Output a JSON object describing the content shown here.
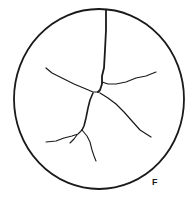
{
  "figure": {
    "label": "F",
    "stroke_color": "#1a1a1a",
    "background": "#ffffff",
    "circle": {
      "cx": 99,
      "cy": 99,
      "rx": 85,
      "ry": 90
    },
    "cracks": [
      {
        "name": "crack-main-vertical",
        "points": "106,10 106,30 105,50 104,68 102,76 102,84 100,90 98,92",
        "width": 1.8
      },
      {
        "name": "crack-right-upper",
        "points": "102,82 108,84 116,84 126,82 136,78 146,76 156,72",
        "width": 1.2
      },
      {
        "name": "crack-left-upper",
        "points": "46,68 52,73 62,78 74,84 86,89 93,92 99,92",
        "width": 1.2
      },
      {
        "name": "crack-right-lower",
        "points": "100,93 108,98 116,104 124,112 132,121 140,130 151,137",
        "width": 1.2
      },
      {
        "name": "crack-down",
        "points": "93,93 90,100 88,108 86,118 84,126 82,130",
        "width": 1.6
      },
      {
        "name": "crack-left-lower",
        "points": "82,130 78,134 72,136 64,138 56,141 46,142",
        "width": 1.1
      },
      {
        "name": "crack-hook",
        "points": "77,135 74,139 70,143",
        "width": 1.1
      },
      {
        "name": "crack-down-lower",
        "points": "82,130 87,136 90,142 92,150 94,156 96,161",
        "width": 1.1
      }
    ]
  }
}
